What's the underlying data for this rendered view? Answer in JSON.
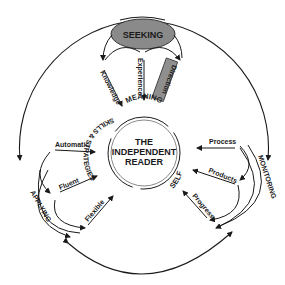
{
  "diagram": {
    "center": {
      "line1": "THE",
      "line2": "INDEPENDENT",
      "line3": "READER"
    },
    "ring_labels": {
      "meaning": "MEANING",
      "skills": "SKILLS & STRATEGIES",
      "self": "SELF"
    },
    "top": {
      "hub": "SEEKING",
      "knowledge": "Knowledge",
      "experience": "Experience",
      "direction": "Direction"
    },
    "left": {
      "hub": "APPLYING",
      "automatic": "Automatic",
      "fluent": "Fluent",
      "flexible": "Flexible"
    },
    "right": {
      "hub": "MONITORING",
      "process": "Process",
      "products": "Products",
      "progress": "Progress"
    },
    "colors": {
      "line": "#1a1a1a",
      "seeking_fill": "#8a8a8a",
      "direction_fill": "#8f8f8f",
      "background": "#ffffff"
    }
  }
}
